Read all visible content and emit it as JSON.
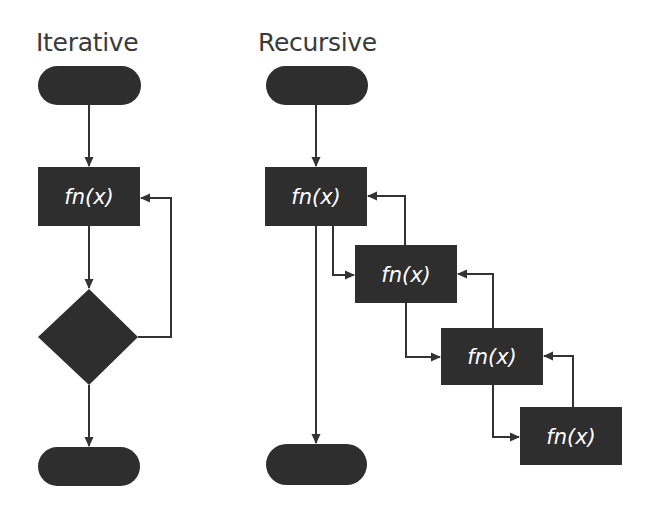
{
  "diagram": {
    "colors": {
      "shape_fill": "#2e2e2e",
      "line": "#333333",
      "label": "#ffffff",
      "title": "#3a3a3a",
      "background": "#ffffff"
    },
    "iterative": {
      "title": "Iterative",
      "nodes": [
        {
          "id": "it-start",
          "type": "terminator",
          "label": ""
        },
        {
          "id": "it-fn",
          "type": "process",
          "label": "fn(x)"
        },
        {
          "id": "it-decision",
          "type": "decision",
          "label": ""
        },
        {
          "id": "it-end",
          "type": "terminator",
          "label": ""
        }
      ],
      "edges": [
        {
          "from": "it-start",
          "to": "it-fn"
        },
        {
          "from": "it-fn",
          "to": "it-decision"
        },
        {
          "from": "it-decision",
          "to": "it-fn",
          "kind": "loop-back"
        },
        {
          "from": "it-decision",
          "to": "it-end"
        }
      ]
    },
    "recursive": {
      "title": "Recursive",
      "nodes": [
        {
          "id": "rc-start",
          "type": "terminator",
          "label": ""
        },
        {
          "id": "rc-fn-1",
          "type": "process",
          "label": "fn(x)"
        },
        {
          "id": "rc-fn-2",
          "type": "process",
          "label": "fn(x)"
        },
        {
          "id": "rc-fn-3",
          "type": "process",
          "label": "fn(x)"
        },
        {
          "id": "rc-fn-4",
          "type": "process",
          "label": "fn(x)"
        },
        {
          "id": "rc-end",
          "type": "terminator",
          "label": ""
        }
      ],
      "edges": [
        {
          "from": "rc-start",
          "to": "rc-fn-1"
        },
        {
          "from": "rc-fn-1",
          "to": "rc-fn-2",
          "kind": "call"
        },
        {
          "from": "rc-fn-2",
          "to": "rc-fn-1",
          "kind": "return"
        },
        {
          "from": "rc-fn-2",
          "to": "rc-fn-3",
          "kind": "call"
        },
        {
          "from": "rc-fn-3",
          "to": "rc-fn-2",
          "kind": "return"
        },
        {
          "from": "rc-fn-3",
          "to": "rc-fn-4",
          "kind": "call"
        },
        {
          "from": "rc-fn-4",
          "to": "rc-fn-3",
          "kind": "return"
        },
        {
          "from": "rc-fn-1",
          "to": "rc-end"
        }
      ]
    }
  }
}
